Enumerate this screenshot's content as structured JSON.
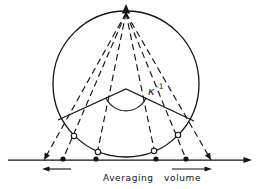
{
  "figure": {
    "background": "#ffffff",
    "ink_color": "#141414",
    "axis_label": "Averaging volume",
    "angle_label": {
      "symbol": "κ",
      "exponent": "-1",
      "full": "κ⁻¹"
    },
    "elements": {
      "circle": "large circle tangent to horizontal axis",
      "apex_arrow": "upward arrowhead at top of circle where six dashed rays converge",
      "dashed_ray_count": 6,
      "filled_axis_dot_count": 4,
      "open_circle_marker_count": 4,
      "cone": "two solid lines forming a V from a vertex inside the circle",
      "angle_arc": "arc spanning the V angle, labeled κ⁻¹",
      "axis": "horizontal line with right-pointing arrowhead",
      "extent_arrows": "outward-pointing left and right arrows below axis marking the averaging volume span"
    }
  }
}
